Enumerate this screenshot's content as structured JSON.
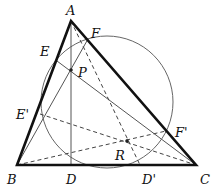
{
  "diagram": {
    "type": "geometry",
    "points": {
      "A": {
        "label": "A",
        "x": 71,
        "y": 21
      },
      "B": {
        "label": "B",
        "x": 17,
        "y": 165
      },
      "C": {
        "label": "C",
        "x": 196,
        "y": 165
      },
      "D": {
        "label": "D",
        "x": 71,
        "y": 165
      },
      "E": {
        "label": "E",
        "x": 57,
        "y": 61
      },
      "F": {
        "label": "F",
        "x": 88,
        "y": 39
      },
      "P": {
        "label": "P",
        "x": 71,
        "y": 70
      },
      "E_prime": {
        "label": "E'",
        "x": 40,
        "y": 114
      },
      "F_prime": {
        "label": "F'",
        "x": 166,
        "y": 131
      },
      "D_prime": {
        "label": "D'",
        "x": 140,
        "y": 165
      },
      "R": {
        "label": "R",
        "x": 127,
        "y": 141
      }
    },
    "circle": {
      "cx": 107,
      "cy": 102,
      "r": 66
    },
    "colors": {
      "triangle": "#111111",
      "thin": "#555555",
      "dashed": "#444444"
    }
  }
}
